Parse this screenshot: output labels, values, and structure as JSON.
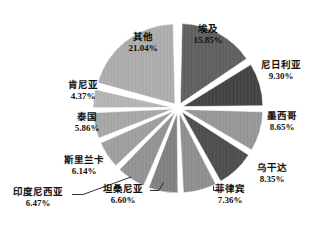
{
  "chart_data": {
    "type": "pie",
    "title": "",
    "subtitle": "",
    "xlabel": "",
    "ylabel": "",
    "legend_position": "none",
    "grid": false,
    "labels_show_percent": true,
    "start_angle_deg": 0,
    "direction": "clockwise",
    "exploded": true,
    "categories": [
      "埃及",
      "尼日利亚",
      "墨西哥",
      "乌干达",
      "菲律宾",
      "坦桑尼亚",
      "印度尼西亚",
      "斯里兰卡",
      "泰国",
      "肯尼亚",
      "其他"
    ],
    "values": [
      15.85,
      9.3,
      8.65,
      8.35,
      7.36,
      6.6,
      6.47,
      6.14,
      5.86,
      4.37,
      21.04
    ],
    "value_labels": [
      "15.85%",
      "9.30%",
      "8.65%",
      "8.35%",
      "7.36%",
      "6.60%",
      "6.47%",
      "6.14%",
      "5.86%",
      "4.37%",
      "21.04%"
    ],
    "colors": [
      "#5c5c5c",
      "#3f3f3f",
      "#929292",
      "#4a4a4a",
      "#8a8a8a",
      "#7c7c7c",
      "#8e8e8e",
      "#9a9a9a",
      "#a2a2a2",
      "#b0b0b0",
      "#a8a8a8"
    ],
    "slices": [
      {
        "name": "埃及",
        "value": 15.85,
        "value_label": "15.85%",
        "color": "#5c5c5c",
        "label_placement": "inside"
      },
      {
        "name": "尼日利亚",
        "value": 9.3,
        "value_label": "9.30%",
        "color": "#3f3f3f",
        "label_placement": "outside"
      },
      {
        "name": "墨西哥",
        "value": 8.65,
        "value_label": "8.65%",
        "color": "#929292",
        "label_placement": "outside"
      },
      {
        "name": "乌干达",
        "value": 8.35,
        "value_label": "8.35%",
        "color": "#4a4a4a",
        "label_placement": "outside"
      },
      {
        "name": "菲律宾",
        "value": 7.36,
        "value_label": "7.36%",
        "color": "#8a8a8a",
        "label_placement": "outside-leader"
      },
      {
        "name": "坦桑尼亚",
        "value": 6.6,
        "value_label": "6.60%",
        "color": "#7c7c7c",
        "label_placement": "outside-leader"
      },
      {
        "name": "印度尼西亚",
        "value": 6.47,
        "value_label": "6.47%",
        "color": "#8e8e8e",
        "label_placement": "outside-leader"
      },
      {
        "name": "斯里兰卡",
        "value": 6.14,
        "value_label": "6.14%",
        "color": "#9a9a9a",
        "label_placement": "outside"
      },
      {
        "name": "泰国",
        "value": 5.86,
        "value_label": "5.86%",
        "color": "#a2a2a2",
        "label_placement": "outside"
      },
      {
        "name": "肯尼亚",
        "value": 4.37,
        "value_label": "4.37%",
        "color": "#b0b0b0",
        "label_placement": "outside"
      },
      {
        "name": "其他",
        "value": 21.04,
        "value_label": "21.04%",
        "color": "#a8a8a8",
        "label_placement": "inside"
      }
    ]
  },
  "labels": {
    "egypt": {
      "name": "埃及",
      "pct": "15.85%"
    },
    "nigeria": {
      "name": "尼日利亚",
      "pct": "9.30%"
    },
    "mexico": {
      "name": "墨西哥",
      "pct": "8.65%"
    },
    "uganda": {
      "name": "乌干达",
      "pct": "8.35%"
    },
    "philippines": {
      "name": "菲律宾",
      "pct": "7.36%"
    },
    "tanzania": {
      "name": "坦桑尼亚",
      "pct": "6.60%"
    },
    "indonesia": {
      "name": "印度尼西亚",
      "pct": "6.47%"
    },
    "srilanka": {
      "name": "斯里兰卡",
      "pct": "6.14%"
    },
    "thailand": {
      "name": "泰国",
      "pct": "5.86%"
    },
    "kenya": {
      "name": "肯尼亚",
      "pct": "4.37%"
    },
    "others": {
      "name": "其他",
      "pct": "21.04%"
    }
  }
}
